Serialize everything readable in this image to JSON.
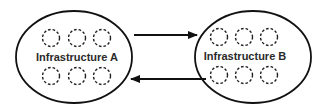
{
  "diagram": {
    "type": "infrastructure-exchange",
    "colors": {
      "stroke": "#111111",
      "text": "#2a2a2a",
      "background": "#ffffff"
    },
    "nodes": [
      {
        "id": "A",
        "label": "Infrastructure A",
        "shape": "ellipse",
        "cx": 74,
        "cy": 57,
        "rx": 58,
        "ry": 46,
        "slots": [
          {
            "cx": 51,
            "cy": 38
          },
          {
            "cx": 77,
            "cy": 38
          },
          {
            "cx": 102,
            "cy": 38
          },
          {
            "cx": 51,
            "cy": 76
          },
          {
            "cx": 77,
            "cy": 76
          },
          {
            "cx": 102,
            "cy": 76
          }
        ]
      },
      {
        "id": "B",
        "label": "Infrastructure B",
        "shape": "ellipse",
        "cx": 253,
        "cy": 57,
        "rx": 58,
        "ry": 46,
        "slots": [
          {
            "cx": 219,
            "cy": 37
          },
          {
            "cx": 244,
            "cy": 37
          },
          {
            "cx": 269,
            "cy": 37
          },
          {
            "cx": 219,
            "cy": 75
          },
          {
            "cx": 244,
            "cy": 75
          },
          {
            "cx": 269,
            "cy": 75
          }
        ]
      }
    ],
    "slot_style": {
      "r": 8.5,
      "dashed": true
    },
    "edges": [
      {
        "from": "A",
        "to": "B",
        "direction": "right",
        "y": 35,
        "x1": 134,
        "x2": 196
      },
      {
        "from": "B",
        "to": "A",
        "direction": "left",
        "y": 79,
        "x1": 206,
        "x2": 132
      }
    ]
  }
}
